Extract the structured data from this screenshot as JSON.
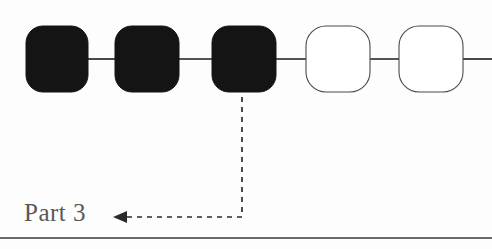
{
  "diagram": {
    "type": "chain-of-rounded-squares",
    "background_color": "#fdfdfd",
    "node_filled_color": "#141414",
    "node_open_fill": "#ffffff",
    "node_open_stroke": "#4a4a4a",
    "connector_color": "#1b1b1b",
    "nodes": [
      {
        "index": 1,
        "name": "node-1",
        "state": "filled",
        "x": 26,
        "y": 26,
        "width": 62,
        "height": 66,
        "radius": 17
      },
      {
        "index": 2,
        "name": "node-2",
        "state": "filled",
        "x": 115,
        "y": 26,
        "width": 64,
        "height": 66,
        "radius": 17
      },
      {
        "index": 3,
        "name": "node-3",
        "state": "filled",
        "x": 212,
        "y": 26,
        "width": 64,
        "height": 66,
        "radius": 17
      },
      {
        "index": 4,
        "name": "node-4",
        "state": "open",
        "x": 306,
        "y": 26,
        "width": 64,
        "height": 66,
        "radius": 20
      },
      {
        "index": 5,
        "name": "node-5",
        "state": "open",
        "x": 399,
        "y": 26,
        "width": 64,
        "height": 66,
        "radius": 20
      }
    ],
    "connectors": [
      {
        "name": "connector-1-2",
        "x1": 88,
        "y1": 59,
        "x2": 115,
        "y2": 59
      },
      {
        "name": "connector-2-3",
        "x1": 179,
        "y1": 59,
        "x2": 212,
        "y2": 59
      },
      {
        "name": "connector-3-4",
        "x1": 276,
        "y1": 59,
        "x2": 306,
        "y2": 59
      },
      {
        "name": "connector-4-5",
        "x1": 370,
        "y1": 59,
        "x2": 399,
        "y2": 59
      },
      {
        "name": "connector-5-edge",
        "x1": 463,
        "y1": 59,
        "x2": 492,
        "y2": 59
      }
    ],
    "callout": {
      "label": "Part 3",
      "label_color": "#585858",
      "target_node": "node-3",
      "path": "M 242 95 L 242 217 L 124 217",
      "arrow_points": "114,217 126,211 126,223",
      "dash_pattern": "5 5",
      "line_color": "#2a2a2a"
    },
    "bottom_rule": {
      "name": "bottom-rule",
      "x1": 0,
      "y1": 238,
      "x2": 492,
      "y2": 238,
      "color": "#3a3a3a"
    }
  }
}
